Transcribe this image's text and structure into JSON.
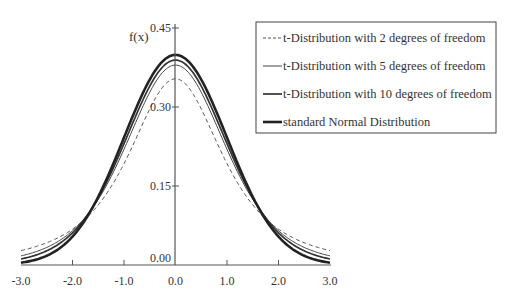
{
  "chart_data": {
    "type": "line",
    "title": "",
    "xlabel": "",
    "ylabel": "f(x)",
    "xlim": [
      -3.0,
      3.0
    ],
    "ylim": [
      0.0,
      0.45
    ],
    "x_ticks": [
      -3.0,
      -2.0,
      -1.0,
      0.0,
      1.0,
      2.0,
      3.0
    ],
    "x_tick_labels": [
      "-3.0",
      "-2.0",
      "-1.0",
      "0.0",
      "1.0",
      "2.0",
      "3.0"
    ],
    "y_ticks": [
      0.0,
      0.15,
      0.3,
      0.45
    ],
    "y_tick_labels": [
      "0.00",
      "0.15",
      "0.30",
      "0.45"
    ],
    "grid": false,
    "legend_position": "top-right",
    "series": [
      {
        "name": "t-Distribution with 2 degrees of freedom",
        "distribution": "t",
        "df": 2,
        "style": "dashed",
        "peak": 0.354,
        "color": "#555555"
      },
      {
        "name": "t-Distribution with 5 degrees of freedom",
        "distribution": "t",
        "df": 5,
        "style": "thin",
        "peak": 0.38,
        "color": "#444444"
      },
      {
        "name": "t-Distribution with 10 degrees of freedom",
        "distribution": "t",
        "df": 10,
        "style": "medium",
        "peak": 0.389,
        "color": "#333333"
      },
      {
        "name": "standard Normal Distribution",
        "distribution": "normal",
        "df": null,
        "style": "thick",
        "peak": 0.399,
        "color": "#222222"
      }
    ]
  }
}
